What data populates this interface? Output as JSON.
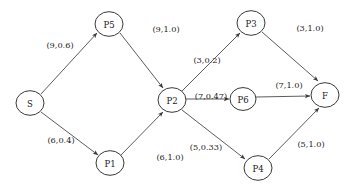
{
  "diagram": {
    "type": "directed-flow-network",
    "nodes": [
      {
        "id": "S",
        "label": "S",
        "cx": 30,
        "cy": 103,
        "r": 14
      },
      {
        "id": "P5",
        "label": "P5",
        "cx": 109,
        "cy": 24,
        "r": 14
      },
      {
        "id": "P1",
        "label": "P1",
        "cx": 110,
        "cy": 163,
        "r": 14
      },
      {
        "id": "P2",
        "label": "P2",
        "cx": 172,
        "cy": 100,
        "r": 14
      },
      {
        "id": "P3",
        "label": "P3",
        "cx": 251,
        "cy": 23,
        "r": 14
      },
      {
        "id": "P6",
        "label": "P6",
        "cx": 243,
        "cy": 99,
        "r": 13
      },
      {
        "id": "P4",
        "label": "P4",
        "cx": 258,
        "cy": 168,
        "r": 14
      },
      {
        "id": "F",
        "label": "F",
        "cx": 325,
        "cy": 95,
        "r": 14
      }
    ],
    "edges": [
      {
        "from": "S",
        "to": "P5",
        "label": "(9,0.6)",
        "capacity": 9,
        "flow_ratio": 0.6,
        "lx": 60,
        "ly": 45,
        "x1": 41,
        "y1": 94,
        "x2": 97,
        "y2": 33
      },
      {
        "from": "S",
        "to": "P1",
        "label": "(6,0.4)",
        "capacity": 6,
        "flow_ratio": 0.4,
        "lx": 61,
        "ly": 140,
        "x1": 41,
        "y1": 112,
        "x2": 98,
        "y2": 155
      },
      {
        "from": "P5",
        "to": "P2",
        "label": "(9,1.0)",
        "capacity": 9,
        "flow_ratio": 1.0,
        "lx": 166,
        "ly": 29,
        "x1": 120,
        "y1": 33,
        "x2": 163,
        "y2": 88
      },
      {
        "from": "P1",
        "to": "P2",
        "label": "(6,1.0)",
        "capacity": 6,
        "flow_ratio": 1.0,
        "lx": 170,
        "ly": 157,
        "x1": 121,
        "y1": 155,
        "x2": 163,
        "y2": 112
      },
      {
        "from": "P2",
        "to": "P3",
        "label": "(3,0.2)",
        "capacity": 3,
        "flow_ratio": 0.2,
        "lx": 207,
        "ly": 60,
        "x1": 182,
        "y1": 91,
        "x2": 240,
        "y2": 33
      },
      {
        "from": "P2",
        "to": "P6",
        "label": "(7,0.47)",
        "capacity": 7,
        "flow_ratio": 0.47,
        "lx": 211,
        "ly": 96,
        "x1": 186,
        "y1": 99,
        "x2": 229,
        "y2": 99
      },
      {
        "from": "P2",
        "to": "P4",
        "label": "(5,0.33)",
        "capacity": 5,
        "flow_ratio": 0.33,
        "lx": 206,
        "ly": 147,
        "x1": 182,
        "y1": 110,
        "x2": 245,
        "y2": 159
      },
      {
        "from": "P3",
        "to": "F",
        "label": "(3,1.0)",
        "capacity": 3,
        "flow_ratio": 1.0,
        "lx": 310,
        "ly": 28,
        "x1": 262,
        "y1": 32,
        "x2": 318,
        "y2": 81
      },
      {
        "from": "P6",
        "to": "F",
        "label": "(7,1.0)",
        "capacity": 7,
        "flow_ratio": 1.0,
        "lx": 289,
        "ly": 85,
        "x1": 256,
        "y1": 97,
        "x2": 310,
        "y2": 96
      },
      {
        "from": "P4",
        "to": "F",
        "label": "(5,1.0)",
        "capacity": 5,
        "flow_ratio": 1.0,
        "lx": 311,
        "ly": 144,
        "x1": 269,
        "y1": 159,
        "x2": 319,
        "y2": 108
      }
    ]
  },
  "colors": {
    "background": "#ffffff",
    "node_stroke": "#3a3a3a",
    "edge_stroke": "#4a4a4a",
    "text": "#1a1a1a"
  }
}
